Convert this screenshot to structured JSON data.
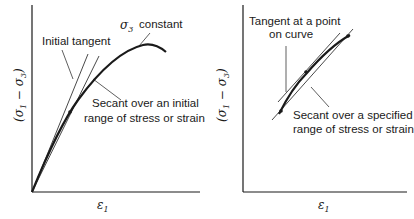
{
  "diagrams": [
    {
      "id": "left",
      "x_label": "ε",
      "x_label_sub": "1",
      "y_label": "(σ1 − σ3)",
      "annotations": {
        "sigma3_constant": "constant",
        "initial_tangent": "Initial tangent",
        "secant_line1": "Secant over an initial",
        "secant_line2": "range of stress or strain"
      }
    },
    {
      "id": "right",
      "x_label": "ε",
      "x_label_sub": "1",
      "y_label": "(σ1 − σ3)",
      "annotations": {
        "tangent_line1": "Tangent at a point",
        "tangent_line2": "on curve",
        "secant_line1": "Secant over a specified",
        "secant_line2": "range of stress or strain"
      }
    }
  ],
  "symbols": {
    "sigma": "σ",
    "minus": "−",
    "sub1": "1",
    "sub3": "3"
  }
}
